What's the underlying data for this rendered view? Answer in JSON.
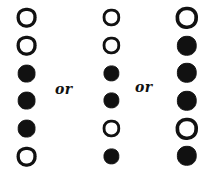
{
  "figure": {
    "background_color": "#ffffff",
    "ink_color": "#111111",
    "separator_label": "or",
    "separators": [
      {
        "name": "or-separator-1",
        "label": "or"
      },
      {
        "name": "or-separator-2",
        "label": "or"
      }
    ],
    "row_count": 6,
    "column_count": 3,
    "states": {
      "open": "open",
      "filled": "filled"
    },
    "columns": [
      {
        "name": "column-1",
        "index": 1,
        "circle_diameter": 17,
        "circles": [
          {
            "row": 1,
            "state": "open"
          },
          {
            "row": 2,
            "state": "open"
          },
          {
            "row": 3,
            "state": "filled"
          },
          {
            "row": 4,
            "state": "filled"
          },
          {
            "row": 5,
            "state": "filled"
          },
          {
            "row": 6,
            "state": "open"
          }
        ]
      },
      {
        "name": "column-2",
        "index": 2,
        "circle_diameter": 15,
        "circles": [
          {
            "row": 1,
            "state": "open"
          },
          {
            "row": 2,
            "state": "open"
          },
          {
            "row": 3,
            "state": "filled"
          },
          {
            "row": 4,
            "state": "filled"
          },
          {
            "row": 5,
            "state": "open"
          },
          {
            "row": 6,
            "state": "filled"
          }
        ]
      },
      {
        "name": "column-3",
        "index": 3,
        "circle_diameter": 19,
        "circles": [
          {
            "row": 1,
            "state": "open"
          },
          {
            "row": 2,
            "state": "filled"
          },
          {
            "row": 3,
            "state": "filled"
          },
          {
            "row": 4,
            "state": "filled"
          },
          {
            "row": 5,
            "state": "open"
          },
          {
            "row": 6,
            "state": "filled"
          }
        ]
      }
    ]
  }
}
